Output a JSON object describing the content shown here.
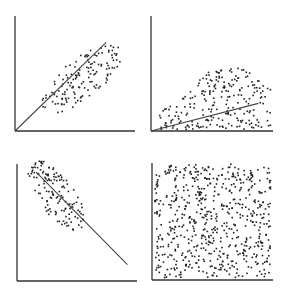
{
  "chart_data": [
    {
      "type": "scatter",
      "title": "",
      "xlabel": "",
      "ylabel": "",
      "description": "Positive linear correlation, elliptical cloud",
      "panel": {
        "x": 15,
        "y": 16,
        "w": 120,
        "h": 115
      },
      "cloud": {
        "cx": 0.55,
        "cy": 0.45,
        "major": 0.42,
        "minor": 0.17,
        "angle_deg": 40,
        "n": 140,
        "seed": 11
      },
      "fit_line": {
        "x1": 0.0,
        "y1": 0.0,
        "x2": 0.76,
        "y2": 0.77
      },
      "grid": false
    },
    {
      "type": "scatter",
      "title": "",
      "xlabel": "",
      "ylabel": "",
      "description": "Weak positive trend with increasing variance (fan / heteroscedastic)",
      "panel": {
        "x": 151,
        "y": 16,
        "w": 122,
        "h": 115
      },
      "fan": {
        "n": 230,
        "seed": 23
      },
      "fit_line": {
        "x1": 0.0,
        "y1": 0.0,
        "x2": 0.88,
        "y2": 0.24
      },
      "grid": false
    },
    {
      "type": "scatter",
      "title": "",
      "xlabel": "",
      "ylabel": "",
      "description": "Negative linear correlation, elliptical cloud",
      "panel": {
        "x": 17,
        "y": 164,
        "w": 120,
        "h": 117
      },
      "cloud": {
        "cx": 0.33,
        "cy": 0.73,
        "major": 0.36,
        "minor": 0.15,
        "angle_deg": -55,
        "n": 140,
        "seed": 37
      },
      "fit_line": {
        "x1": 0.16,
        "y1": 0.93,
        "x2": 0.92,
        "y2": 0.14
      },
      "grid": false
    },
    {
      "type": "scatter",
      "title": "",
      "xlabel": "",
      "ylabel": "",
      "description": "No correlation, uniform random points",
      "panel": {
        "x": 152,
        "y": 163,
        "w": 121,
        "h": 117
      },
      "uniform": {
        "n": 620,
        "seed": 51
      },
      "fit_line": null,
      "grid": false
    }
  ],
  "style": {
    "axis_color": "#333333",
    "dot_color": "#222222",
    "line_color": "#444444",
    "background": "#ffffff"
  }
}
